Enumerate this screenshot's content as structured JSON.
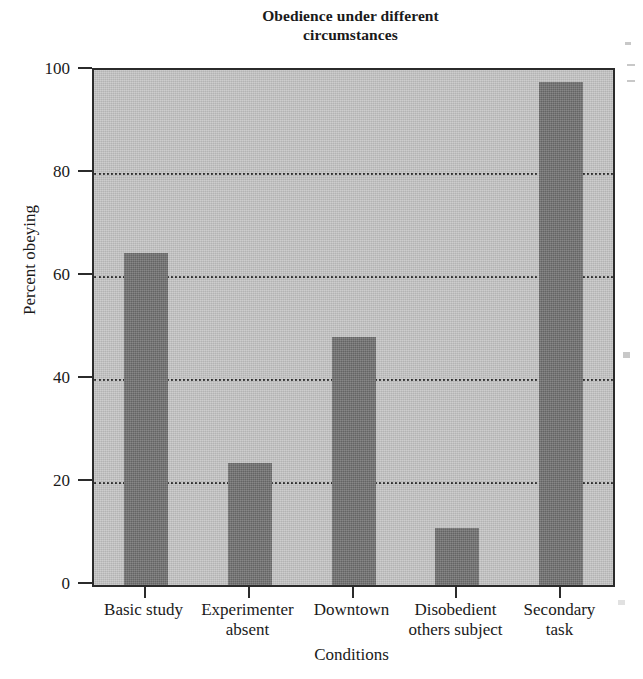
{
  "chart_data": {
    "type": "bar",
    "title": "Obedience under different circumstances",
    "title_lines": [
      "Obedience under different",
      "circumstances"
    ],
    "xlabel": "Conditions",
    "ylabel": "Percent obeying",
    "categories": [
      "Basic study",
      "Experimenter absent",
      "Downtown",
      "Disobedient others subject",
      "Secondary task"
    ],
    "category_lines": [
      [
        "Basic study",
        ""
      ],
      [
        "Experimenter",
        "absent"
      ],
      [
        "Downtown",
        ""
      ],
      [
        "Disobedient",
        "others subject"
      ],
      [
        "Secondary",
        "task"
      ]
    ],
    "values": [
      64.5,
      23.7,
      48.2,
      11.1,
      97.7
    ],
    "ylim": [
      0,
      100
    ],
    "y_ticks": [
      0,
      20,
      40,
      60,
      80,
      100
    ],
    "y_tick_labels": [
      "0",
      "20",
      "40",
      "60",
      "80",
      "100"
    ],
    "gridlines_at": [
      20,
      40,
      60,
      80
    ],
    "grid": true,
    "legend": null,
    "legend_position": "none",
    "bar_color": "#6d6d6d",
    "plot_background": "#c3c3c3",
    "axis_color": "#2b2b2b",
    "gridline_color": "#2e2e2e"
  }
}
